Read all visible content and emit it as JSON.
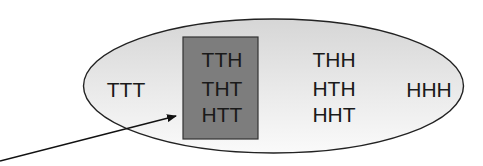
{
  "diagram": {
    "type": "sample-space-event",
    "ellipse": {
      "label": "sample space",
      "fill_top": "#dcdcdc",
      "fill_bottom": "#f6f6f6",
      "stroke": "#222222"
    },
    "event_box": {
      "fill": "#7a7a7a",
      "stroke": "#333333",
      "outcomes": [
        "TTH",
        "THT",
        "HTT"
      ]
    },
    "outcomes": {
      "left": "TTT",
      "middle": [
        "THH",
        "HTH",
        "HHT"
      ],
      "right": "HHH"
    },
    "arrow": {
      "points_to": "event_box"
    }
  }
}
